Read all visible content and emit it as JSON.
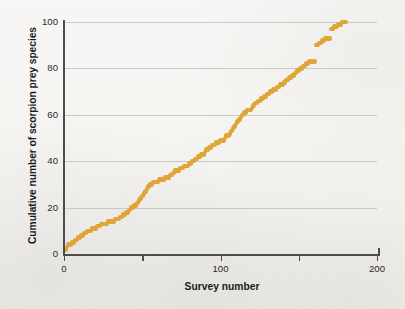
{
  "figure": {
    "background_color": "#f6f5f3",
    "marker_color": "#dda637",
    "axis_color": "#4d4d4d",
    "grid_color": "#c9c9c9"
  },
  "axes": {
    "xlabel": "Survey number",
    "ylabel": "Cumulative number of scorpion prey species",
    "x_ticks_major": [
      "0",
      "100",
      "200"
    ],
    "x_ticks_minor": [
      "50",
      "150"
    ],
    "y_ticks": [
      "0",
      "20",
      "40",
      "60",
      "80",
      "100"
    ]
  },
  "chart_data": {
    "type": "scatter",
    "title": "",
    "subtitle": "",
    "xlabel": "Survey number",
    "ylabel": "Cumulative number of scorpion prey species",
    "xlim": [
      0,
      200
    ],
    "ylim": [
      0,
      100
    ],
    "xticks": [
      0,
      50,
      100,
      150,
      200
    ],
    "xticklabels": [
      "0",
      "",
      "100",
      "",
      "200"
    ],
    "yticks": [
      0,
      20,
      40,
      60,
      80,
      100
    ],
    "yticklabels": [
      "0",
      "20",
      "40",
      "60",
      "80",
      "100"
    ],
    "grid": "horizontal",
    "legend": "none",
    "annotations": [],
    "series": [
      {
        "name": "Cumulative prey species",
        "marker": "circle",
        "color": "#dda637",
        "x": [
          1,
          2,
          3,
          4,
          5,
          6,
          7,
          8,
          9,
          10,
          11,
          12,
          13,
          14,
          15,
          16,
          17,
          18,
          19,
          20,
          21,
          22,
          23,
          24,
          25,
          26,
          27,
          28,
          29,
          30,
          31,
          32,
          33,
          34,
          35,
          36,
          37,
          38,
          39,
          40,
          41,
          42,
          43,
          44,
          45,
          46,
          47,
          48,
          49,
          50,
          51,
          52,
          53,
          54,
          55,
          56,
          57,
          58,
          59,
          60,
          61,
          62,
          63,
          64,
          65,
          66,
          67,
          68,
          69,
          70,
          71,
          72,
          73,
          74,
          75,
          76,
          77,
          78,
          79,
          80,
          81,
          82,
          83,
          84,
          85,
          86,
          87,
          88,
          89,
          90,
          91,
          92,
          93,
          94,
          95,
          96,
          97,
          98,
          99,
          100,
          101,
          102,
          103,
          104,
          105,
          106,
          107,
          108,
          109,
          110,
          111,
          112,
          113,
          114,
          115,
          116,
          117,
          118,
          119,
          120,
          121,
          122,
          123,
          124,
          125,
          126,
          127,
          128,
          129,
          130,
          131,
          132,
          133,
          134,
          135,
          136,
          137,
          138,
          139,
          140,
          141,
          142,
          143,
          144,
          145,
          146,
          147,
          148,
          149,
          150,
          151,
          152,
          153,
          154,
          155,
          156,
          157,
          158,
          159,
          160,
          161,
          162,
          163,
          164,
          165,
          166,
          167,
          168,
          169,
          170,
          171,
          172,
          173,
          174,
          175,
          176,
          177,
          178,
          179,
          180
        ],
        "y": [
          2,
          3,
          4,
          4,
          5,
          5,
          6,
          6,
          7,
          7,
          8,
          8,
          9,
          9,
          10,
          10,
          10,
          11,
          11,
          11,
          12,
          12,
          12,
          13,
          13,
          13,
          13,
          14,
          14,
          14,
          14,
          14,
          15,
          15,
          15,
          16,
          16,
          17,
          17,
          18,
          18,
          19,
          20,
          20,
          21,
          21,
          22,
          23,
          24,
          25,
          26,
          27,
          28,
          29,
          30,
          30,
          31,
          31,
          31,
          31,
          32,
          32,
          32,
          32,
          33,
          33,
          33,
          34,
          34,
          35,
          36,
          36,
          36,
          37,
          37,
          37,
          38,
          38,
          38,
          39,
          39,
          40,
          40,
          41,
          41,
          42,
          42,
          43,
          43,
          44,
          45,
          45,
          46,
          46,
          47,
          47,
          48,
          48,
          48,
          49,
          49,
          49,
          50,
          51,
          51,
          52,
          53,
          54,
          55,
          56,
          57,
          58,
          59,
          60,
          61,
          61,
          62,
          62,
          62,
          63,
          64,
          65,
          65,
          66,
          66,
          67,
          67,
          68,
          68,
          69,
          69,
          70,
          70,
          71,
          71,
          72,
          72,
          73,
          73,
          73,
          74,
          75,
          75,
          76,
          76,
          77,
          77,
          78,
          79,
          79,
          80,
          80,
          81,
          81,
          82,
          82,
          83,
          83,
          83,
          83,
          90,
          90,
          91,
          91,
          92,
          92,
          93,
          93,
          93,
          93,
          97,
          97,
          98,
          98,
          99,
          99,
          99,
          100,
          100,
          100
        ]
      }
    ]
  }
}
